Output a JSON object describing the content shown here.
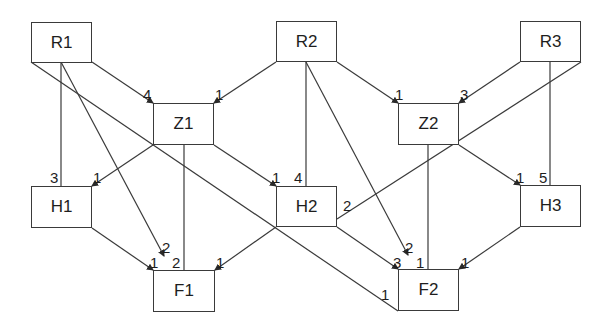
{
  "nodes": [
    {
      "id": "R1",
      "label": "R1",
      "x": 31,
      "y": 22,
      "w": 61,
      "h": 41
    },
    {
      "id": "R2",
      "label": "R2",
      "x": 276,
      "y": 21,
      "w": 61,
      "h": 41
    },
    {
      "id": "R3",
      "label": "R3",
      "x": 520,
      "y": 21,
      "w": 61,
      "h": 41
    },
    {
      "id": "Z1",
      "label": "Z1",
      "x": 153,
      "y": 103,
      "w": 61,
      "h": 42
    },
    {
      "id": "Z2",
      "label": "Z2",
      "x": 398,
      "y": 103,
      "w": 61,
      "h": 42
    },
    {
      "id": "H1",
      "label": "H1",
      "x": 31,
      "y": 186,
      "w": 61,
      "h": 42
    },
    {
      "id": "H2",
      "label": "H2",
      "x": 276,
      "y": 186,
      "w": 61,
      "h": 41
    },
    {
      "id": "H3",
      "label": "H3",
      "x": 520,
      "y": 185,
      "w": 61,
      "h": 42
    },
    {
      "id": "F1",
      "label": "F1",
      "x": 153,
      "y": 270,
      "w": 62,
      "h": 42
    },
    {
      "id": "F2",
      "label": "F2",
      "x": 398,
      "y": 269,
      "w": 61,
      "h": 42
    }
  ],
  "edges": [
    {
      "from": "R1",
      "to": "Z1",
      "x1": 92,
      "y1": 62,
      "x2": 153,
      "y2": 103,
      "label": "4",
      "lx": 143,
      "ly": 87,
      "arrow": true
    },
    {
      "from": "R2",
      "to": "Z1",
      "x1": 276,
      "y1": 62,
      "x2": 214,
      "y2": 103,
      "label": "1",
      "lx": 215,
      "ly": 87,
      "arrow": true
    },
    {
      "from": "R2",
      "to": "Z2",
      "x1": 337,
      "y1": 62,
      "x2": 398,
      "y2": 103,
      "label": "1",
      "lx": 395,
      "ly": 87,
      "arrow": true
    },
    {
      "from": "R3",
      "to": "Z2",
      "x1": 520,
      "y1": 62,
      "x2": 459,
      "y2": 103,
      "label": "3",
      "lx": 460,
      "ly": 87,
      "arrow": true
    },
    {
      "from": "R1",
      "to": "H1",
      "x1": 61,
      "y1": 62,
      "x2": 61,
      "y2": 186,
      "label": "3",
      "lx": 50,
      "ly": 170,
      "arrow": false
    },
    {
      "from": "Z1",
      "to": "H1",
      "x1": 153,
      "y1": 145,
      "x2": 92,
      "y2": 186,
      "label": "1",
      "lx": 93,
      "ly": 170,
      "arrow": true
    },
    {
      "from": "Z1",
      "to": "H2",
      "x1": 214,
      "y1": 145,
      "x2": 276,
      "y2": 186,
      "label": "1",
      "lx": 272,
      "ly": 170,
      "arrow": true
    },
    {
      "from": "R2",
      "to": "H2",
      "x1": 306,
      "y1": 62,
      "x2": 306,
      "y2": 186,
      "label": "4",
      "lx": 294,
      "ly": 170,
      "arrow": false
    },
    {
      "from": "Z2",
      "to": "H3",
      "x1": 459,
      "y1": 145,
      "x2": 520,
      "y2": 185,
      "label": "1",
      "lx": 516,
      "ly": 170,
      "arrow": true
    },
    {
      "from": "R3",
      "to": "H3",
      "x1": 550,
      "y1": 62,
      "x2": 550,
      "y2": 185,
      "label": "5",
      "lx": 539,
      "ly": 170,
      "arrow": false
    },
    {
      "from": "R3",
      "to": "H2",
      "x1": 581,
      "y1": 62,
      "x2": 337,
      "y2": 219,
      "label": "2",
      "lx": 343,
      "ly": 198,
      "arrow": false
    },
    {
      "from": "R1",
      "to": "F1",
      "x1": 61,
      "y1": 62,
      "x2": 164,
      "y2": 256,
      "label": "2",
      "lx": 162,
      "ly": 240,
      "arrow": true
    },
    {
      "from": "Z1",
      "to": "F1",
      "x1": 184,
      "y1": 145,
      "x2": 184,
      "y2": 270,
      "label": "2",
      "lx": 172,
      "ly": 255,
      "arrow": false
    },
    {
      "from": "H1",
      "to": "F1",
      "x1": 92,
      "y1": 228,
      "x2": 153,
      "y2": 270,
      "label": "1",
      "lx": 150,
      "ly": 255,
      "arrow": true
    },
    {
      "from": "H2",
      "to": "F1",
      "x1": 276,
      "y1": 227,
      "x2": 215,
      "y2": 270,
      "label": "1",
      "lx": 216,
      "ly": 255,
      "arrow": true
    },
    {
      "from": "R1",
      "to": "F2",
      "x1": 31,
      "y1": 62,
      "x2": 398,
      "y2": 311,
      "label": "1",
      "lx": 381,
      "ly": 287,
      "arrow": false
    },
    {
      "from": "R2",
      "to": "F2",
      "x1": 306,
      "y1": 62,
      "x2": 408,
      "y2": 255,
      "label": "2",
      "lx": 405,
      "ly": 240,
      "arrow": true
    },
    {
      "from": "Z2",
      "to": "F2",
      "x1": 428,
      "y1": 145,
      "x2": 428,
      "y2": 269,
      "label": "1",
      "lx": 416,
      "ly": 255,
      "arrow": false
    },
    {
      "from": "H2",
      "to": "F2",
      "x1": 337,
      "y1": 227,
      "x2": 398,
      "y2": 269,
      "label": "3",
      "lx": 393,
      "ly": 255,
      "arrow": true
    },
    {
      "from": "H3",
      "to": "F2",
      "x1": 520,
      "y1": 227,
      "x2": 459,
      "y2": 269,
      "label": "1",
      "lx": 461,
      "ly": 255,
      "arrow": true
    }
  ],
  "colors": {
    "line": "#3a3a3a",
    "text": "#1e1e1e",
    "background": "#ffffff"
  }
}
